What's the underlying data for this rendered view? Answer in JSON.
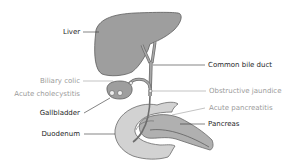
{
  "diagram": {
    "type": "anatomical",
    "colors": {
      "organ_fill": "#9e9e9e",
      "organ_stroke": "#5e5e5e",
      "duodenum_fill": "#d2d2d2",
      "pancreas_fill": "#b0b0b0",
      "label_dark": "#1e1e1e",
      "label_light": "#9a9a9a",
      "leader_line": "#555555"
    },
    "labels": {
      "liver": "Liver",
      "common_bile_duct": "Common bile duct",
      "biliary_colic": "Biliary colic",
      "acute_cholecystitis": "Acute cholecystitis",
      "obstructive_jaundice": "Obstructive jaundice",
      "acute_pancreatitis": "Acute pancreatitis",
      "gallbladder": "Gallbladder",
      "pancreas": "Pancreas",
      "duodenum": "Duodenum"
    }
  }
}
